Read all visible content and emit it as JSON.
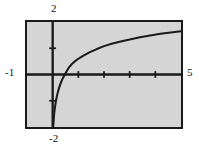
{
  "figure": {
    "kind": "graphing-window",
    "background_color": "#ffffff",
    "window_fill_color": "#d5d5d5",
    "frame_color": "#1a1a1a",
    "curve_color": "#1a1a1a"
  },
  "labels": {
    "y_max": "2",
    "y_min": "-2",
    "x_min": "-1",
    "x_max": "5"
  },
  "chart_data": {
    "type": "line",
    "title": "",
    "xlabel": "",
    "ylabel": "",
    "xlim": [
      -1,
      5
    ],
    "ylim": [
      -2,
      2
    ],
    "grid": false,
    "legend": null,
    "axis_tick_spacing": {
      "x": 1,
      "y": 1
    },
    "x_ticks": [
      1,
      2,
      3,
      4
    ],
    "y_ticks": [
      1,
      -1
    ],
    "x_tick_labels": [],
    "y_tick_labels": [],
    "annotations": [
      {
        "text": "2",
        "position": "above-y-axis",
        "value": 2
      },
      {
        "text": "-2",
        "position": "below-y-axis",
        "value": -2
      },
      {
        "text": "-1",
        "position": "left-of-x-axis",
        "value": -1
      },
      {
        "text": "5",
        "position": "right-of-x-axis",
        "value": 5
      }
    ],
    "series": [
      {
        "name": "curve",
        "description": "natural-logarithm-shaped increasing concave curve with vertical asymptote at x = 0",
        "x": [
          0.02,
          0.04,
          0.06,
          0.09,
          0.12,
          0.16,
          0.2,
          0.26,
          0.32,
          0.4,
          0.5,
          0.62,
          0.75,
          0.9,
          1.0,
          1.2,
          1.45,
          1.7,
          2.0,
          2.3,
          2.65,
          3.0,
          3.4,
          3.8,
          4.2,
          4.6,
          5.0
        ],
        "y": [
          -2.0,
          -1.72,
          -1.48,
          -1.24,
          -1.05,
          -0.85,
          -0.68,
          -0.48,
          -0.31,
          -0.13,
          0.05,
          0.25,
          0.4,
          0.53,
          0.6,
          0.72,
          0.85,
          0.96,
          1.08,
          1.17,
          1.26,
          1.33,
          1.42,
          1.49,
          1.55,
          1.6,
          1.65
        ]
      }
    ]
  }
}
